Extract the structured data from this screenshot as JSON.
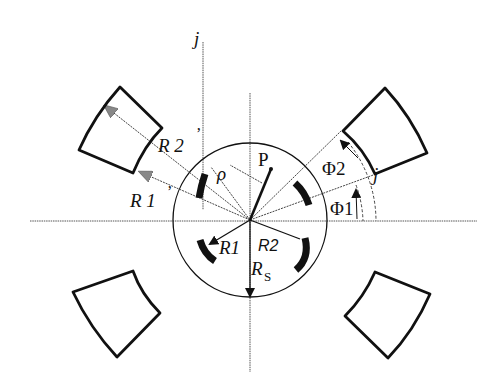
{
  "diagram": {
    "labels": {
      "axis_j_top": "j",
      "magnet_j": "j",
      "point_p": "P",
      "rho": "ρ",
      "r2_prime": "R 2",
      "r2_prime_mark": "’",
      "r1_prime": "R 1",
      "r1_prime_mark": "’",
      "phi2": "Φ2",
      "phi1": "Φ1",
      "r1": "R1",
      "r2": "R2",
      "rs": "R",
      "rs_sub": "S"
    },
    "colors": {
      "stroke": "#111111",
      "dotted": "#555555",
      "background": "#ffffff"
    },
    "geometry": {
      "center": [
        250,
        220
      ],
      "circle_radius": 77,
      "magnet_count": 4
    }
  }
}
